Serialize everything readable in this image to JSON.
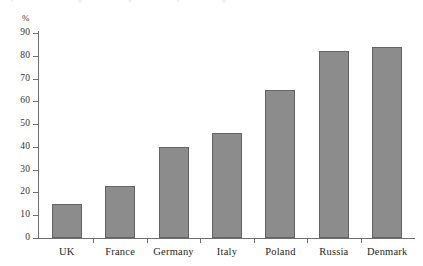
{
  "chart_data": {
    "type": "bar",
    "title": "",
    "subtitle": "",
    "xlabel": "",
    "ylabel": "%",
    "unit_label": "%",
    "categories": [
      "UK",
      "France",
      "Germany",
      "Italy",
      "Poland",
      "Russia",
      "Denmark"
    ],
    "values": [
      15,
      23,
      40,
      46,
      65,
      82,
      84
    ],
    "ylim": [
      0,
      90
    ],
    "ytick_step": 10,
    "yticks": [
      0,
      10,
      20,
      30,
      40,
      50,
      60,
      70,
      80,
      90
    ],
    "ytick_labels": [
      "0",
      "10",
      "20",
      "30",
      "40",
      "50",
      "60",
      "70",
      "80",
      "90"
    ],
    "grid": false,
    "legend": null,
    "legend_position": "none",
    "annotations": [],
    "colors": {
      "bar_fill": "#8c8c8c",
      "bar_stroke": "#636363",
      "axis": "#6e6e6e",
      "text": "#262626",
      "background": "#ffffff"
    }
  }
}
